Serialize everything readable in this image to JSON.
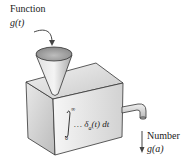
{
  "input": {
    "title": "Function",
    "symbol": "g(t)"
  },
  "machine": {
    "integral_upper": "∞",
    "integral_lower": "0",
    "integrand": "… δ",
    "subscript": "a",
    "tail": "(t) dt"
  },
  "output": {
    "title": "Number",
    "symbol": "g(a)"
  },
  "colors": {
    "box_light": "#efefef",
    "box_mid": "#d8d8d8",
    "box_dark": "#bdbdbd",
    "stroke": "#333333"
  }
}
